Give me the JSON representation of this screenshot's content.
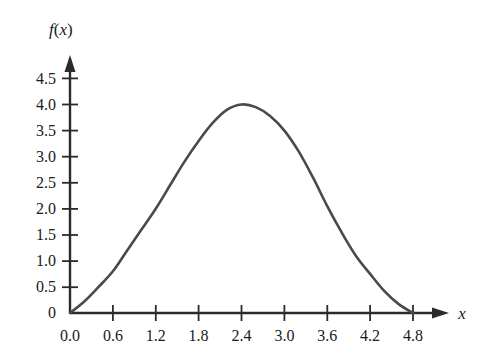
{
  "figure": {
    "background_color": "#ffffff",
    "curve_color": "#4a4a4a",
    "axis_color": "#2b2b2b",
    "text_color": "#1a1a1a"
  },
  "labels": {
    "y_axis_label": "f(x)",
    "y_axis_label_f": "f",
    "y_axis_label_paren_open": "(",
    "y_axis_label_var": "x",
    "y_axis_label_paren_close": ")",
    "x_axis_label": "x"
  },
  "chart_data": {
    "type": "line",
    "title": "",
    "xlabel": "x",
    "ylabel": "f(x)",
    "xlim": [
      0.0,
      5.1
    ],
    "ylim": [
      0.0,
      4.8
    ],
    "grid": false,
    "legend": "none",
    "x_ticks": [
      "0.0",
      "0.6",
      "1.2",
      "1.8",
      "2.4",
      "3.0",
      "3.6",
      "4.2",
      "4.8"
    ],
    "x_tick_values": [
      0.0,
      0.6,
      1.2,
      1.8,
      2.4,
      3.0,
      3.6,
      4.2,
      4.8
    ],
    "y_ticks": [
      "0",
      "0.5",
      "1.0",
      "1.5",
      "2.0",
      "2.5",
      "3.0",
      "3.5",
      "4.0",
      "4.5"
    ],
    "y_tick_values": [
      0.0,
      0.5,
      1.0,
      1.5,
      2.0,
      2.5,
      3.0,
      3.5,
      4.0,
      4.5
    ],
    "origin_label": "0",
    "series": [
      {
        "name": "f(x)",
        "color": "#4a4a4a",
        "x": [
          0.0,
          0.2,
          0.4,
          0.6,
          0.8,
          1.0,
          1.2,
          1.4,
          1.6,
          1.8,
          2.0,
          2.2,
          2.4,
          2.6,
          2.8,
          3.0,
          3.2,
          3.4,
          3.6,
          3.8,
          4.0,
          4.2,
          4.4,
          4.6,
          4.8
        ],
        "y": [
          0.0,
          0.22,
          0.5,
          0.8,
          1.2,
          1.6,
          2.0,
          2.45,
          2.9,
          3.3,
          3.65,
          3.9,
          4.0,
          3.95,
          3.78,
          3.5,
          3.1,
          2.6,
          2.05,
          1.55,
          1.1,
          0.75,
          0.42,
          0.17,
          0.0
        ]
      }
    ],
    "peak": {
      "x": 2.4,
      "y": 4.0
    },
    "roots": [
      0.0,
      4.8
    ]
  }
}
